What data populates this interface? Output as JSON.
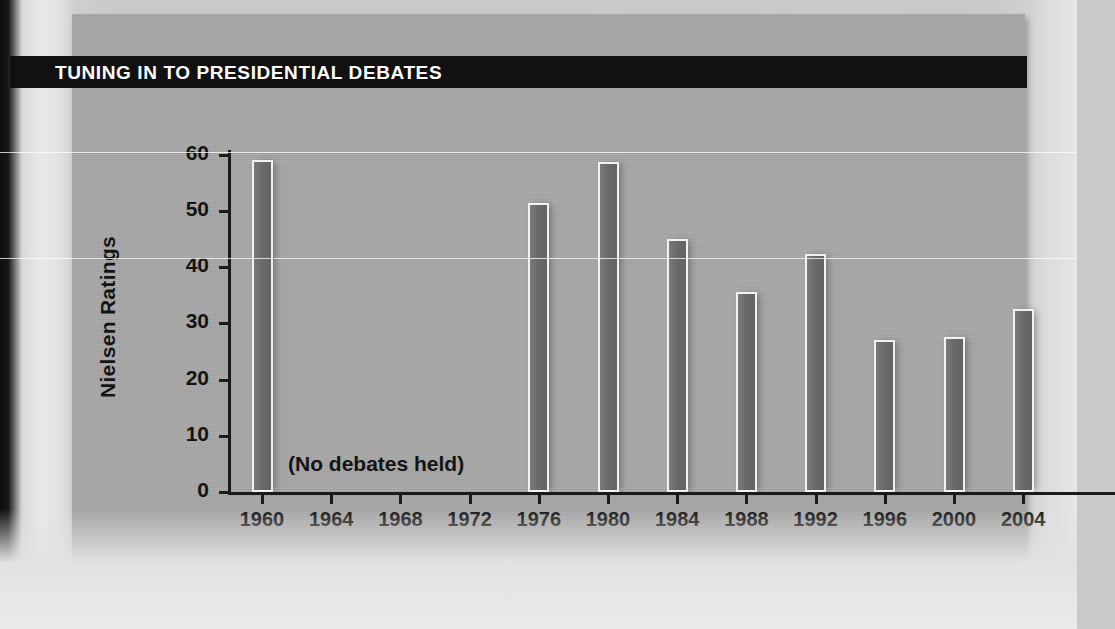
{
  "page": {
    "banner_title": "TUNING IN TO PRESIDENTIAL DEBATES",
    "banner_color": "#111111",
    "panel_color": "#a9a9a9",
    "bar_color": "#6a6a6a",
    "bar_outline_color": "#f2f2f2",
    "text_color": "#141414"
  },
  "chart_data": {
    "type": "bar",
    "title": "TUNING IN TO PRESIDENTIAL DEBATES",
    "xlabel": "",
    "ylabel": "Nielsen Ratings",
    "categories": [
      "1960",
      "1964",
      "1968",
      "1972",
      "1976",
      "1980",
      "1984",
      "1988",
      "1992",
      "1996",
      "2000",
      "2004"
    ],
    "values": [
      59.0,
      null,
      null,
      null,
      51.5,
      58.8,
      45.0,
      35.5,
      42.3,
      27.1,
      27.5,
      32.5
    ],
    "ylim": [
      0,
      62
    ],
    "yticks": [
      0,
      10,
      20,
      30,
      40,
      50,
      60
    ],
    "ytick_labels": [
      "0",
      "10",
      "20",
      "30",
      "40",
      "50",
      "60"
    ],
    "grid": false,
    "legend": false,
    "annotations": [
      {
        "text": "(No debates held)",
        "x_category_range": [
          "1964",
          "1972"
        ],
        "y": 5
      }
    ]
  }
}
